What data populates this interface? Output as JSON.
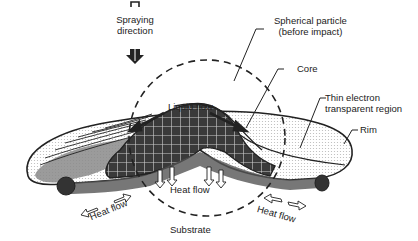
{
  "figure": {
    "type": "schematic"
  },
  "labels": {
    "spraying_direction": [
      "Spraying",
      "direction"
    ],
    "spherical_particle": [
      "Spherical particle",
      "(before impact)"
    ],
    "core": "Core",
    "thin_region": [
      "Thin electron",
      "transparent region"
    ],
    "rim": "Rim",
    "liquid_flow": "Liquid flow",
    "heat_flow_center": "Heat flow",
    "heat_flow_left": "Heat flow",
    "heat_flow_right": "Heat flow",
    "substrate": "Substrate"
  },
  "colors": {
    "ink": "#222222",
    "core_fill": "#3a3a3a",
    "shade": "#9a9a9a",
    "light_shade": "#e4e4e4",
    "background": "#ffffff"
  }
}
